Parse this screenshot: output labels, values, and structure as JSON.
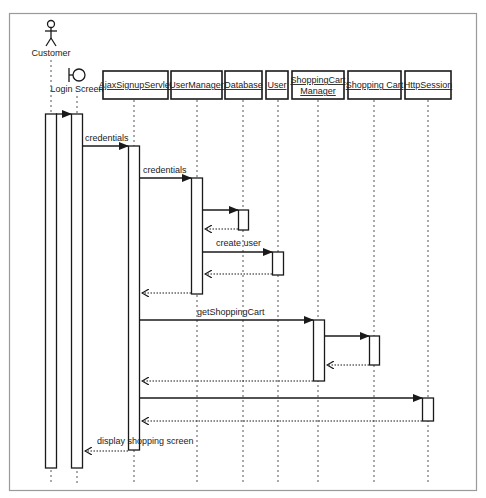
{
  "diagram": {
    "type": "UML sequence diagram",
    "actors": [
      {
        "id": "customer",
        "label": "Customer",
        "kind": "actor"
      },
      {
        "id": "login",
        "label": "Login Screen",
        "kind": "boundary"
      }
    ],
    "objects": [
      {
        "id": "servlet",
        "label": "AjaxSignupServlet"
      },
      {
        "id": "usermgr",
        "label": "UserManager"
      },
      {
        "id": "database",
        "label": "Database"
      },
      {
        "id": "user",
        "label": "User"
      },
      {
        "id": "scm",
        "label_line1": "ShoppingCart",
        "label_line2": "Manager"
      },
      {
        "id": "cart",
        "label": "Shopping Cart"
      },
      {
        "id": "session",
        "label": "HttpSession"
      }
    ],
    "messages": [
      {
        "from": "customer",
        "to": "login",
        "label": "",
        "type": "call"
      },
      {
        "from": "login",
        "to": "servlet",
        "label": "credentials",
        "type": "call"
      },
      {
        "from": "servlet",
        "to": "usermgr",
        "label": "credentials",
        "type": "call"
      },
      {
        "from": "usermgr",
        "to": "database",
        "label": "",
        "type": "call"
      },
      {
        "from": "database",
        "to": "usermgr",
        "label": "",
        "type": "return"
      },
      {
        "from": "usermgr",
        "to": "user",
        "label": "create user",
        "type": "call"
      },
      {
        "from": "user",
        "to": "usermgr",
        "label": "",
        "type": "return"
      },
      {
        "from": "usermgr",
        "to": "servlet",
        "label": "",
        "type": "return"
      },
      {
        "from": "servlet",
        "to": "scm",
        "label": "getShoppingCart",
        "type": "call"
      },
      {
        "from": "scm",
        "to": "cart",
        "label": "",
        "type": "call"
      },
      {
        "from": "cart",
        "to": "scm",
        "label": "",
        "type": "return"
      },
      {
        "from": "scm",
        "to": "servlet",
        "label": "",
        "type": "return"
      },
      {
        "from": "servlet",
        "to": "session",
        "label": "",
        "type": "call"
      },
      {
        "from": "session",
        "to": "servlet",
        "label": "",
        "type": "return"
      },
      {
        "from": "servlet",
        "to": "login",
        "label": "display shopping screen",
        "type": "return"
      }
    ]
  }
}
